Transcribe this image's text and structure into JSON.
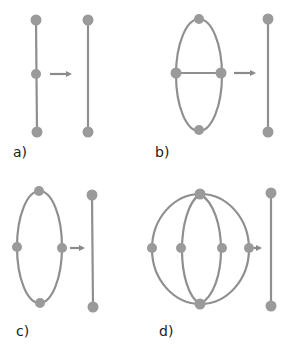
{
  "colors": {
    "node": "#9a9a9a",
    "edge": "#8f8f8f",
    "arrow": "#8a8a8a",
    "text": "#1a1a1a",
    "background": "#ffffff"
  },
  "panels": [
    {
      "label": "a)",
      "description": "Path of three vertices (line with middle node) reduces to a single edge",
      "left_graph": {
        "nodes": [
          [
            36,
            20
          ],
          [
            36,
            74
          ],
          [
            37,
            132
          ]
        ],
        "edges": [
          [
            0,
            1
          ],
          [
            1,
            2
          ]
        ]
      },
      "arrow": {
        "from": [
          50,
          74
        ],
        "to": [
          74,
          74
        ]
      },
      "right_graph": {
        "nodes": [
          [
            88,
            20
          ],
          [
            88,
            132
          ]
        ],
        "edges": [
          [
            0,
            1
          ]
        ]
      }
    },
    {
      "label": "b)",
      "description": "Ellipse with four nodes and a horizontal chord reduces to a single edge",
      "left_graph": {
        "nodes": [
          [
            199,
            19
          ],
          [
            176,
            73
          ],
          [
            221,
            73
          ],
          [
            199,
            130
          ]
        ],
        "edges": [
          "ellipse",
          [
            1,
            2
          ]
        ]
      },
      "arrow": {
        "from": [
          234,
          73
        ],
        "to": [
          258,
          73
        ]
      },
      "right_graph": {
        "nodes": [
          [
            268,
            19
          ],
          [
            268,
            132
          ]
        ],
        "edges": [
          [
            0,
            1
          ]
        ]
      }
    },
    {
      "label": "c)",
      "description": "Ellipse with four nodes reduces to a single edge",
      "left_graph": {
        "nodes": [
          [
            39,
            191
          ],
          [
            17,
            247
          ],
          [
            61,
            247
          ],
          [
            40,
            303
          ]
        ],
        "edges": [
          "ellipse"
        ]
      },
      "arrow": {
        "from": [
          70,
          248
        ],
        "to": [
          86,
          248
        ]
      },
      "right_graph": {
        "nodes": [
          [
            92,
            195
          ],
          [
            92,
            307
          ]
        ],
        "edges": [
          [
            0,
            1
          ]
        ]
      }
    },
    {
      "label": "d)",
      "description": "Circle with two inner arcs (six nodes) reduces to a single edge",
      "left_graph": {
        "nodes": [
          [
            200,
            194
          ],
          [
            152,
            248
          ],
          [
            181,
            248
          ],
          [
            222,
            248
          ],
          [
            249,
            248
          ],
          [
            200,
            304
          ]
        ],
        "edges": [
          "outer-circle",
          "inner-arc-left",
          "inner-arc-right"
        ]
      },
      "arrow": {
        "from": [
          254,
          248
        ],
        "to": [
          263,
          248
        ]
      },
      "right_graph": {
        "nodes": [
          [
            271,
            193
          ],
          [
            271,
            306
          ]
        ],
        "edges": [
          [
            0,
            1
          ]
        ]
      }
    }
  ]
}
